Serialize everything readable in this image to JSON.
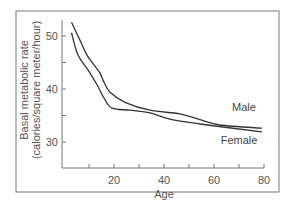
{
  "chart_data": {
    "type": "line",
    "title": "",
    "xlabel": "Age",
    "ylabel": "Basal metabolic rate (calories/square meter/hour)",
    "ylabel_lines": [
      "Basal metabolic rate",
      "(calories/square meter/hour)"
    ],
    "xlim": [
      0,
      80
    ],
    "ylim": [
      25,
      54
    ],
    "x_ticks": [
      10,
      20,
      30,
      40,
      50,
      60,
      70,
      80
    ],
    "x_tick_labels": [
      {
        "value": 20,
        "label": "20"
      },
      {
        "value": 40,
        "label": "40"
      },
      {
        "value": 60,
        "label": "60"
      },
      {
        "value": 80,
        "label": "80"
      }
    ],
    "y_ticks": [
      30,
      35,
      40,
      45,
      50
    ],
    "y_tick_labels": [
      {
        "value": 30,
        "label": "30"
      },
      {
        "value": 40,
        "label": "40"
      },
      {
        "value": 50,
        "label": "50"
      }
    ],
    "grid": false,
    "legend_position": "inline labels near right end of curves",
    "series": [
      {
        "name": "Male",
        "color": "#333333",
        "points": [
          [
            3,
            52.6
          ],
          [
            6.4,
            49.2
          ],
          [
            9.2,
            46.4
          ],
          [
            12.4,
            44.3
          ],
          [
            14.4,
            43.0
          ],
          [
            16,
            41.3
          ],
          [
            18.4,
            39.4
          ],
          [
            24.4,
            37.5
          ],
          [
            34.4,
            36.0
          ],
          [
            46.4,
            35.3
          ],
          [
            54.4,
            34.2
          ],
          [
            62.4,
            33.2
          ],
          [
            79.2,
            32.6
          ]
        ],
        "label_pos": [
          72,
          35.8
        ]
      },
      {
        "name": "Female",
        "color": "#333333",
        "points": [
          [
            3,
            50.6
          ],
          [
            5.6,
            46.4
          ],
          [
            9.6,
            43.6
          ],
          [
            13.2,
            40.8
          ],
          [
            16,
            38.3
          ],
          [
            19.2,
            36.4
          ],
          [
            26.4,
            36.0
          ],
          [
            34.4,
            35.5
          ],
          [
            42.4,
            34.3
          ],
          [
            54.4,
            33.4
          ],
          [
            79.2,
            31.9
          ]
        ],
        "label_pos": [
          70,
          29.6
        ]
      }
    ]
  },
  "colors": {
    "frame": "#777777",
    "axis": "#777777",
    "line": "#333333",
    "text": "#555555"
  }
}
